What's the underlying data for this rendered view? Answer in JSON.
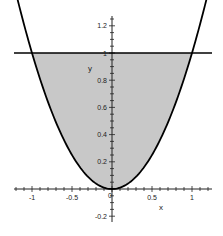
{
  "chart_data": {
    "type": "area",
    "title": "",
    "xlabel": "x",
    "ylabel": "y",
    "xlim": [
      -1.25,
      1.25
    ],
    "ylim": [
      -0.25,
      1.3
    ],
    "grid": false,
    "legend": null,
    "x_ticks": [
      -1,
      -0.5,
      0,
      0.5,
      1
    ],
    "x_tick_labels": [
      "-1",
      "-0.5",
      "0",
      "0.5",
      "1"
    ],
    "y_ticks": [
      -0.2,
      0.2,
      0.4,
      0.6,
      0.8,
      1,
      1.2
    ],
    "y_tick_labels": [
      "-0.2",
      "0.2",
      "0.4",
      "0.6",
      "0.8",
      "1",
      "1.2"
    ],
    "series": [
      {
        "name": "y = x^2",
        "kind": "curve",
        "x_range": [
          -1.18,
          1.18
        ],
        "color": "#000000"
      },
      {
        "name": "y = 1",
        "kind": "line",
        "x_range": [
          -1.2,
          1.2
        ],
        "color": "#000000"
      },
      {
        "name": "region between y = x^2 and y = 1",
        "kind": "fill",
        "x_range": [
          -1,
          1
        ],
        "color": "#c8c8c8"
      }
    ]
  },
  "colors": {
    "fill": "#c8c8c8",
    "curve": "#000000",
    "axis": "#222222"
  }
}
